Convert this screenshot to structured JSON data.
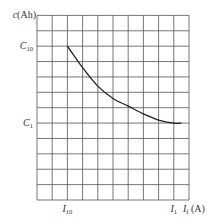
{
  "chart_data": {
    "type": "line",
    "title": "",
    "ylabel": "c(Ah)",
    "xlabel": "I_f (A)",
    "grid": true,
    "grid_divisions": {
      "x": 10,
      "y": 12
    },
    "xlim": [
      0,
      10
    ],
    "ylim": [
      0,
      12
    ],
    "x_ticks": [
      {
        "value": 2,
        "label": "I",
        "sub": "10"
      },
      {
        "value": 9,
        "label": "I",
        "sub": "1"
      }
    ],
    "y_ticks": [
      {
        "value": 10,
        "label": "C",
        "sub": "10"
      },
      {
        "value": 5,
        "label": "C",
        "sub": "1"
      }
    ],
    "y_axis_label": {
      "main": "c",
      "rest": "(Ah)"
    },
    "x_axis_label": {
      "main": "I",
      "sub": "f",
      "rest": " (A)"
    },
    "series": [
      {
        "name": "capacity-vs-discharge-current",
        "x": [
          2,
          3,
          4,
          5,
          6,
          7,
          8,
          9,
          9.5
        ],
        "y": [
          10,
          8.6,
          7.4,
          6.6,
          6.1,
          5.6,
          5.2,
          5.0,
          5.0
        ]
      }
    ]
  }
}
